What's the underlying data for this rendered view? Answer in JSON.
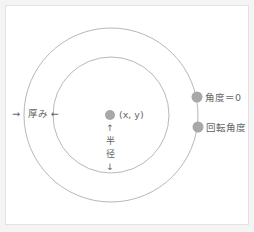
{
  "diagram": {
    "center_label": "(x, y)",
    "thickness_label": "厚み",
    "thickness_left_arrow": "→",
    "thickness_right_arrow": "←",
    "radius_up_arrow": "↑",
    "radius_char1": "半",
    "radius_char2": "径",
    "radius_down_arrow": "↓",
    "angle_zero_label": "角度＝0",
    "rotation_angle_label": "回転角度"
  },
  "colors": {
    "circle_stroke": "#b8b8b8",
    "dot_fill": "#a8a8a8",
    "text": "#666666"
  }
}
